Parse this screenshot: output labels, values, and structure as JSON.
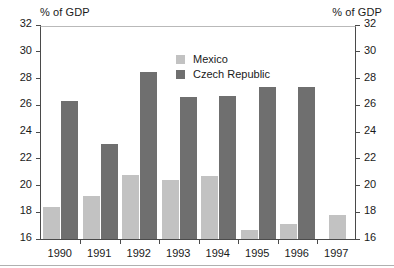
{
  "axis_unit_label_left": "% of GDP",
  "axis_unit_label_right": "% of GDP",
  "legend": {
    "entries": [
      {
        "label": "Mexico",
        "color": "#c2c2c2"
      },
      {
        "label": "Czech Republic",
        "color": "#6f6f6f"
      }
    ]
  },
  "chart_data": {
    "type": "bar",
    "title": "",
    "subtitle": "",
    "xlabel": "",
    "ylabel": "% of GDP",
    "ylabel_right": "% of GDP",
    "categories": [
      "1990",
      "1991",
      "1992",
      "1993",
      "1994",
      "1995",
      "1996",
      "1997"
    ],
    "series": [
      {
        "name": "Mexico",
        "color": "#c2c2c2",
        "values": [
          18.4,
          19.2,
          20.8,
          20.4,
          20.7,
          16.7,
          17.1,
          17.8
        ]
      },
      {
        "name": "Czech Republic",
        "color": "#6f6f6f",
        "values": [
          26.3,
          23.1,
          28.5,
          26.6,
          26.7,
          27.4,
          27.4,
          null
        ]
      }
    ],
    "ylim": [
      16,
      32
    ],
    "yticks": [
      16,
      18,
      20,
      22,
      24,
      26,
      28,
      30,
      32
    ],
    "ytick_labels": [
      "16",
      "18",
      "20",
      "22",
      "24",
      "26",
      "28",
      "30",
      "32"
    ],
    "grid": false,
    "legend_position": "upper-center",
    "dual_axis": true
  }
}
